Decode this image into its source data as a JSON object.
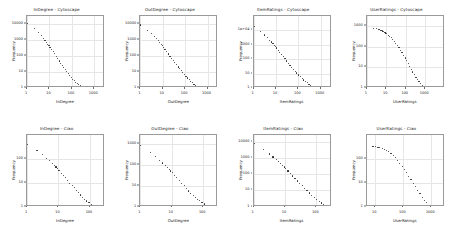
{
  "figure": {
    "layout": "2 rows x 4 columns grid of log-log scatter plots",
    "rows": [
      "Cytoscape",
      "Ciao"
    ],
    "background_color": "#ffffff",
    "point_color": "#2b2b2b",
    "grid_color": "#e6e6e6",
    "axis_color": "#9a9a9a"
  },
  "chart_data": [
    {
      "type": "scatter",
      "title": "InDegree - Cytoscape",
      "xlabel": "InDegree",
      "ylabel": "Frequency",
      "xscale": "log",
      "yscale": "log",
      "xlim": [
        1,
        3000
      ],
      "ylim": [
        1,
        30000
      ],
      "xticks": [
        1,
        10,
        100,
        1000
      ],
      "yticks": [
        1,
        10,
        100,
        1000,
        10000
      ],
      "xticklabels": [
        "1",
        "10",
        "100",
        "1000"
      ],
      "yticklabels": [
        "1",
        "10",
        "100",
        "1000",
        "10000"
      ],
      "grid": true,
      "legend": "none",
      "x": [
        1,
        2,
        3,
        4,
        5,
        6,
        7,
        8,
        9,
        10,
        12,
        14,
        16,
        19,
        22,
        26,
        30,
        35,
        41,
        48,
        56,
        65,
        76,
        89,
        104,
        121,
        141,
        165,
        192,
        224,
        262,
        306,
        357,
        417,
        487,
        568,
        663,
        774,
        903,
        1054,
        1230,
        1436,
        1676,
        1956
      ],
      "y": [
        11000,
        5200,
        3000,
        1950,
        1350,
        980,
        740,
        570,
        450,
        360,
        255,
        190,
        145,
        100,
        72,
        52,
        38,
        28,
        21,
        15,
        11,
        8.5,
        6.4,
        4.9,
        3.8,
        3.0,
        2.4,
        2.0,
        1.7,
        1.5,
        1.3,
        1.2,
        1.1,
        1.1,
        1,
        1,
        1,
        1,
        1,
        1,
        1,
        1,
        1,
        1
      ]
    },
    {
      "type": "scatter",
      "title": "OutDegree - Cytoscape",
      "xlabel": "OutDegree",
      "ylabel": "Frequency",
      "xscale": "log",
      "yscale": "log",
      "xlim": [
        1,
        3000
      ],
      "ylim": [
        1,
        30000
      ],
      "xticks": [
        1,
        10,
        100,
        1000
      ],
      "yticks": [
        1,
        10,
        100,
        1000,
        10000
      ],
      "xticklabels": [
        "1",
        "10",
        "100",
        "1000"
      ],
      "yticklabels": [
        "1",
        "10",
        "100",
        "1000",
        "10000"
      ],
      "grid": true,
      "legend": "none",
      "x": [
        1,
        2,
        3,
        4,
        5,
        6,
        7,
        8,
        9,
        10,
        12,
        14,
        17,
        20,
        24,
        28,
        33,
        39,
        46,
        54,
        64,
        75,
        88,
        104,
        122,
        144,
        169,
        199,
        234,
        275,
        323,
        380,
        447,
        526,
        618,
        727,
        855,
        1005,
        1182,
        1390
      ],
      "y": [
        9000,
        4300,
        2600,
        1750,
        1250,
        930,
        720,
        570,
        460,
        380,
        270,
        200,
        140,
        100,
        73,
        54,
        40,
        30,
        22,
        17,
        13,
        9.8,
        7.5,
        5.8,
        4.5,
        3.6,
        2.9,
        2.3,
        1.9,
        1.6,
        1.4,
        1.2,
        1.1,
        1,
        1,
        1,
        1,
        1,
        1,
        1
      ]
    },
    {
      "type": "scatter",
      "title": "ItemRatings - Cytoscape",
      "xlabel": "ItemRatings",
      "ylabel": "Frequency",
      "xscale": "log",
      "yscale": "log",
      "xlim": [
        1,
        3000
      ],
      "ylim": [
        1,
        100000
      ],
      "xticks": [
        1,
        10,
        100,
        1000
      ],
      "yticks": [
        1,
        10,
        100,
        1000,
        10000
      ],
      "xticklabels": [
        "1",
        "10",
        "100",
        "1000"
      ],
      "yticklabels": [
        "1",
        "10",
        "100",
        "1000",
        "1e+04"
      ],
      "grid": true,
      "legend": "none",
      "x": [
        1,
        2,
        3,
        4,
        5,
        6,
        7,
        8,
        9,
        10,
        12,
        14,
        17,
        20,
        24,
        28,
        34,
        40,
        48,
        57,
        68,
        81,
        97,
        116,
        138,
        165,
        197,
        235,
        281,
        335,
        400,
        478,
        570,
        681,
        813,
        970,
        1158,
        1382,
        1650
      ],
      "y": [
        21000,
        9500,
        5300,
        3400,
        2300,
        1700,
        1300,
        1000,
        800,
        650,
        450,
        330,
        225,
        160,
        115,
        83,
        58,
        42,
        30,
        22,
        16,
        12,
        8.8,
        6.6,
        5.0,
        3.9,
        3.1,
        2.5,
        2.0,
        1.7,
        1.4,
        1.2,
        1.1,
        1,
        1,
        1,
        1,
        1,
        1
      ]
    },
    {
      "type": "scatter",
      "title": "UserRatings - Cytoscape",
      "xlabel": "UserRatings",
      "ylabel": "Frequency",
      "xscale": "log",
      "yscale": "log",
      "xlim": [
        1,
        10000
      ],
      "ylim": [
        1,
        3000
      ],
      "xticks": [
        1,
        10,
        100,
        1000
      ],
      "yticks": [
        1,
        10,
        100,
        1000
      ],
      "xticklabels": [
        "1",
        "10",
        "100",
        "1000"
      ],
      "yticklabels": [
        "1",
        "10",
        "100",
        "1000"
      ],
      "grid": true,
      "legend": "none",
      "x": [
        2,
        3,
        4,
        5,
        6,
        7,
        8,
        9,
        10,
        12,
        14,
        17,
        20,
        24,
        29,
        35,
        42,
        50,
        60,
        72,
        87,
        104,
        125,
        150,
        180,
        216,
        260,
        312,
        375,
        450,
        540,
        648,
        778,
        934,
        1121,
        1345,
        1614,
        1937
      ],
      "y": [
        800,
        760,
        700,
        650,
        600,
        560,
        520,
        480,
        440,
        380,
        330,
        280,
        230,
        185,
        150,
        118,
        92,
        70,
        53,
        40,
        30,
        22,
        16,
        12,
        8.6,
        6.3,
        4.7,
        3.5,
        2.7,
        2.1,
        1.7,
        1.4,
        1.2,
        1.1,
        1,
        1,
        1,
        1
      ]
    },
    {
      "type": "scatter",
      "title": "InDegree - Ciao",
      "xlabel": "InDegree",
      "ylabel": "Frequency",
      "xscale": "log",
      "yscale": "log",
      "xlim": [
        1,
        300
      ],
      "ylim": [
        1,
        1000
      ],
      "xticks": [
        1,
        10,
        100
      ],
      "yticks": [
        1,
        10,
        100
      ],
      "xticklabels": [
        "1",
        "10",
        "100"
      ],
      "yticklabels": [
        "1",
        "10",
        "100"
      ],
      "grid": true,
      "legend": "none",
      "x": [
        1,
        2,
        3,
        4,
        5,
        6,
        7,
        8,
        9,
        10,
        12,
        14,
        16,
        19,
        22,
        26,
        30,
        35,
        41,
        48,
        56,
        65,
        76,
        89,
        104,
        121,
        141,
        165,
        192
      ],
      "y": [
        420,
        230,
        150,
        110,
        85,
        68,
        56,
        47,
        40,
        34,
        26,
        21,
        17,
        13,
        10,
        8,
        6.3,
        5,
        4,
        3.2,
        2.6,
        2.1,
        1.8,
        1.5,
        1.3,
        1.2,
        1.1,
        1,
        1
      ]
    },
    {
      "type": "scatter",
      "title": "OutDegree - Ciao",
      "xlabel": "OutDegree",
      "ylabel": "Frequency",
      "xscale": "log",
      "yscale": "log",
      "xlim": [
        1,
        300
      ],
      "ylim": [
        1,
        3000
      ],
      "xticks": [
        1,
        10,
        100
      ],
      "yticks": [
        1,
        10,
        100,
        1000
      ],
      "xticklabels": [
        "1",
        "10",
        "100"
      ],
      "yticklabels": [
        "1",
        "10",
        "100",
        "1000"
      ],
      "grid": true,
      "legend": "none",
      "x": [
        1,
        2,
        3,
        4,
        5,
        6,
        7,
        8,
        9,
        10,
        12,
        14,
        17,
        20,
        24,
        28,
        33,
        39,
        46,
        54,
        64,
        75,
        88,
        104,
        122,
        144,
        169,
        199
      ],
      "y": [
        900,
        440,
        270,
        185,
        135,
        103,
        82,
        66,
        55,
        46,
        34,
        26,
        19,
        14,
        10.5,
        8,
        6,
        4.7,
        3.7,
        3,
        2.4,
        2,
        1.6,
        1.4,
        1.2,
        1.1,
        1,
        1
      ]
    },
    {
      "type": "scatter",
      "title": "ItemRatings - Ciao",
      "xlabel": "ItemRatings",
      "ylabel": "Frequency",
      "xscale": "log",
      "yscale": "log",
      "xlim": [
        1,
        300
      ],
      "ylim": [
        1,
        30000
      ],
      "xticks": [
        1,
        10,
        100
      ],
      "yticks": [
        1,
        10,
        100,
        1000,
        10000
      ],
      "xticklabels": [
        "1",
        "10",
        "100"
      ],
      "yticklabels": [
        "1",
        "10",
        "100",
        "1000",
        "10000"
      ],
      "grid": true,
      "legend": "none",
      "x": [
        1,
        2,
        3,
        4,
        5,
        6,
        7,
        8,
        9,
        10,
        12,
        14,
        17,
        20,
        24,
        28,
        34,
        40,
        48,
        57,
        68,
        81,
        97,
        116,
        138,
        165
      ],
      "y": [
        8500,
        3600,
        2000,
        1300,
        900,
        660,
        500,
        390,
        310,
        250,
        175,
        125,
        85,
        60,
        42,
        30,
        21,
        15,
        10.5,
        7.5,
        5.5,
        4,
        3,
        2.3,
        1.8,
        1.4
      ]
    },
    {
      "type": "scatter",
      "title": "UserRatings - Ciao",
      "xlabel": "UserRatings",
      "ylabel": "Frequency",
      "xscale": "log",
      "yscale": "log",
      "xlim": [
        5,
        3000
      ],
      "ylim": [
        1,
        1000
      ],
      "xticks": [
        10,
        100,
        1000
      ],
      "yticks": [
        1,
        10,
        100
      ],
      "xticklabels": [
        "10",
        "100",
        "1000"
      ],
      "yticklabels": [
        "1",
        "10",
        "100"
      ],
      "grid": true,
      "legend": "none",
      "x": [
        8,
        10,
        12,
        14,
        17,
        20,
        24,
        29,
        35,
        42,
        50,
        60,
        72,
        87,
        104,
        125,
        150,
        180,
        216,
        260,
        312,
        375,
        450,
        540,
        648,
        778,
        934,
        1121,
        1345
      ],
      "y": [
        340,
        330,
        315,
        300,
        280,
        255,
        230,
        200,
        170,
        140,
        112,
        88,
        67,
        50,
        37,
        27,
        19,
        14,
        9.8,
        7,
        5,
        3.6,
        2.6,
        1.9,
        1.5,
        1.2,
        1,
        1,
        1
      ]
    }
  ]
}
